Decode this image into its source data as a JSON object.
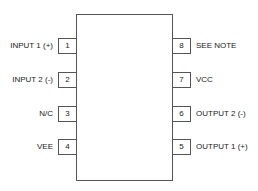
{
  "diagram": {
    "type": "ic-pinout",
    "package": "8-pin",
    "left_pins": [
      {
        "number": "1",
        "label": "INPUT 1 (+)",
        "top": 38
      },
      {
        "number": "2",
        "label": "INPUT 2 (-)",
        "top": 72
      },
      {
        "number": "3",
        "label": "N/C",
        "top": 106
      },
      {
        "number": "4",
        "label": "VEE",
        "top": 139
      }
    ],
    "right_pins": [
      {
        "number": "8",
        "label": "SEE NOTE",
        "top": 38
      },
      {
        "number": "7",
        "label": "VCC",
        "top": 72
      },
      {
        "number": "6",
        "label": "OUTPUT 2 (-)",
        "top": 106
      },
      {
        "number": "5",
        "label": "OUTPUT 1 (+)",
        "top": 139
      }
    ]
  }
}
